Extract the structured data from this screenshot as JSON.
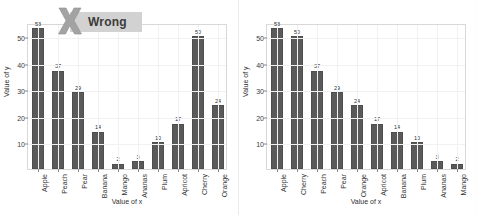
{
  "figure": {
    "background_color": "#fdfdfd",
    "bar_color": "#5a5a5a",
    "banner_color": "#d2d2d2",
    "mark_color": "#9e9e9e",
    "gridline_color": "#f1f1f1"
  },
  "panels": [
    {
      "id": "wrong",
      "banner_label": "Wrong",
      "icons": [
        "x-mark-icon"
      ]
    },
    {
      "id": "correct",
      "banner_label": "Correct",
      "icons": [
        "check-mark-icon",
        "smiley-face-icon"
      ]
    }
  ],
  "chart_data": [
    {
      "type": "bar",
      "panel": "wrong",
      "title": "Wrong",
      "xlabel": "Value of x",
      "ylabel": "Value of y",
      "categories": [
        "Apple",
        "Peach",
        "Pear",
        "Banana",
        "Mango",
        "Ananas",
        "Plum",
        "Apricot",
        "Cherry",
        "Orange"
      ],
      "values": [
        53,
        37,
        29,
        14,
        2,
        3,
        10,
        17,
        50,
        24
      ],
      "ylim": [
        0,
        55
      ],
      "yticks": [
        10,
        20,
        30,
        40,
        50
      ],
      "grid": true,
      "legend": "none",
      "annotation": "Categories are in arbitrary order, so the bar heights are hard to compare."
    },
    {
      "type": "bar",
      "panel": "correct",
      "title": "Correct",
      "xlabel": "Value of x",
      "ylabel": "Value of y",
      "categories": [
        "Apple",
        "Cherry",
        "Peach",
        "Pear",
        "Orange",
        "Apricot",
        "Banana",
        "Plum",
        "Ananas",
        "Mango"
      ],
      "values": [
        53,
        50,
        37,
        29,
        24,
        17,
        14,
        10,
        3,
        2
      ],
      "ylim": [
        0,
        55
      ],
      "yticks": [
        10,
        20,
        30,
        40,
        50
      ],
      "grid": true,
      "legend": "none",
      "annotation": "Categories sorted by descending value, so ranking is immediately readable."
    }
  ]
}
